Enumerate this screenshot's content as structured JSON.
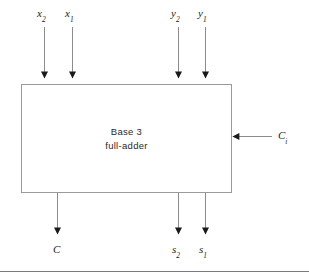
{
  "figure": {
    "kind": "block-diagram",
    "width": 309,
    "height": 278,
    "background_color": "#ffffff",
    "line_color": "#8c8c8c",
    "arrow_color": "#1a1a1a",
    "text_color": "#1a1a1a"
  },
  "block": {
    "title_line1": "Base 3",
    "title_line2": "full-adder",
    "border_color": "#9a9a9a",
    "fill_color": "#ffffff",
    "x": 21,
    "y": 84,
    "width": 211,
    "height": 109
  },
  "inputs_top": [
    {
      "label": "x",
      "subscript": "2",
      "x": 44
    },
    {
      "label": "x",
      "subscript": "1",
      "x": 72
    },
    {
      "label": "y",
      "subscript": "2",
      "x": 178
    },
    {
      "label": "y",
      "subscript": "1",
      "x": 205
    }
  ],
  "input_right": {
    "label": "C",
    "subscript": "i",
    "y": 136,
    "line_start_x": 272,
    "line_end_x": 234
  },
  "outputs_bottom": [
    {
      "label": "C",
      "subscript": "",
      "x": 57
    },
    {
      "label": "s",
      "subscript": "2",
      "x": 178
    },
    {
      "label": "s",
      "subscript": "1",
      "x": 205
    }
  ],
  "footer_rule": {
    "color": "#7a7a7a",
    "y": 271
  }
}
